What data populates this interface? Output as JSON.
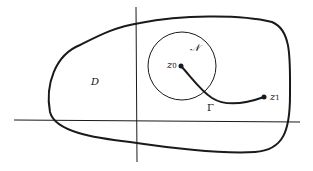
{
  "diagram": {
    "region_label": "D",
    "neighborhood_label": "𝒩",
    "curve_label": "Γ",
    "start_point": {
      "symbol": "z",
      "subscript": "0"
    },
    "end_point": {
      "symbol": "z",
      "subscript": "1"
    },
    "stroke_color": "#1a1a1a"
  }
}
